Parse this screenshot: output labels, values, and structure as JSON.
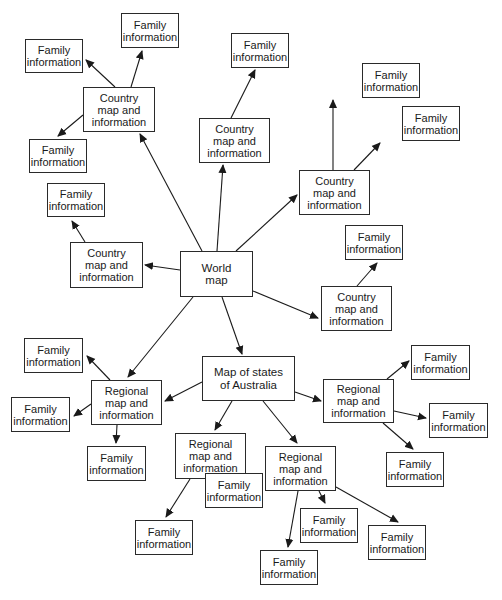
{
  "diagram": {
    "title": "",
    "nodes": [
      {
        "id": "world",
        "label": "World\nmap",
        "x": 180,
        "y": 251,
        "w": 73,
        "h": 46
      },
      {
        "id": "australia",
        "label": "Map of states\nof Australia",
        "x": 202,
        "y": 356,
        "w": 93,
        "h": 45
      },
      {
        "id": "country_tl",
        "label": "Country\nmap and\ninformation",
        "x": 83,
        "y": 87,
        "w": 72,
        "h": 45
      },
      {
        "id": "country_c",
        "label": "Country\nmap and\ninformation",
        "x": 199,
        "y": 118,
        "w": 71,
        "h": 45
      },
      {
        "id": "country_r",
        "label": "Country\nmap and\ninformation",
        "x": 299,
        "y": 170,
        "w": 71,
        "h": 45
      },
      {
        "id": "country_l",
        "label": "Country\nmap and\ninformation",
        "x": 70,
        "y": 242,
        "w": 73,
        "h": 46
      },
      {
        "id": "country_rl",
        "label": "Country\nmap and\ninformation",
        "x": 321,
        "y": 286,
        "w": 71,
        "h": 45
      },
      {
        "id": "regional_l",
        "label": "Regional\nmap and\ninformation",
        "x": 91,
        "y": 380,
        "w": 71,
        "h": 45
      },
      {
        "id": "regional_c1",
        "label": "Regional\nmap and\ninformation",
        "x": 175,
        "y": 433,
        "w": 71,
        "h": 46
      },
      {
        "id": "regional_c2",
        "label": "Regional\nmap and\ninformation",
        "x": 265,
        "y": 446,
        "w": 71,
        "h": 45
      },
      {
        "id": "regional_r",
        "label": "Regional\nmap and\ninformation",
        "x": 323,
        "y": 379,
        "w": 71,
        "h": 44
      },
      {
        "id": "fi_1",
        "label": "Family\ninformation",
        "x": 25,
        "y": 39,
        "w": 58,
        "h": 34
      },
      {
        "id": "fi_2",
        "label": "Family\ninformation",
        "x": 121,
        "y": 13,
        "w": 58,
        "h": 35
      },
      {
        "id": "fi_3",
        "label": "Family\ninformation",
        "x": 29,
        "y": 139,
        "w": 58,
        "h": 34
      },
      {
        "id": "fi_4",
        "label": "Family\ninformation",
        "x": 231,
        "y": 33,
        "w": 58,
        "h": 35
      },
      {
        "id": "fi_5",
        "label": "Family\ninformation",
        "x": 362,
        "y": 63,
        "w": 58,
        "h": 35
      },
      {
        "id": "fi_6",
        "label": "Family\ninformation",
        "x": 402,
        "y": 106,
        "w": 58,
        "h": 35
      },
      {
        "id": "fi_7",
        "label": "Family\ninformation",
        "x": 47,
        "y": 183,
        "w": 58,
        "h": 34
      },
      {
        "id": "fi_8",
        "label": "Family\ninformation",
        "x": 345,
        "y": 225,
        "w": 58,
        "h": 35
      },
      {
        "id": "fi_9",
        "label": "Family\ninformation",
        "x": 24,
        "y": 338,
        "w": 59,
        "h": 35
      },
      {
        "id": "fi_10",
        "label": "Family\ninformation",
        "x": 11,
        "y": 397,
        "w": 59,
        "h": 35
      },
      {
        "id": "fi_11",
        "label": "Family\ninformation",
        "x": 87,
        "y": 446,
        "w": 59,
        "h": 35
      },
      {
        "id": "fi_12",
        "label": "Family\ninformation",
        "x": 205,
        "y": 473,
        "w": 58,
        "h": 35
      },
      {
        "id": "fi_13",
        "label": "Family\ninformation",
        "x": 135,
        "y": 520,
        "w": 58,
        "h": 35
      },
      {
        "id": "fi_14",
        "label": "Family\ninformation",
        "x": 300,
        "y": 508,
        "w": 58,
        "h": 35
      },
      {
        "id": "fi_15",
        "label": "Family\ninformation",
        "x": 368,
        "y": 525,
        "w": 58,
        "h": 35
      },
      {
        "id": "fi_16",
        "label": "Family\ninformation",
        "x": 260,
        "y": 550,
        "w": 58,
        "h": 35
      },
      {
        "id": "fi_17",
        "label": "Family\ninformation",
        "x": 411,
        "y": 345,
        "w": 59,
        "h": 35
      },
      {
        "id": "fi_18",
        "label": "Family\ninformation",
        "x": 429,
        "y": 403,
        "w": 59,
        "h": 35
      },
      {
        "id": "fi_19",
        "label": "Family\ninformation",
        "x": 386,
        "y": 452,
        "w": 58,
        "h": 35
      }
    ],
    "edges": [
      {
        "from": "world",
        "to": "country_tl",
        "x1": 202,
        "y1": 251,
        "x2": 140,
        "y2": 134
      },
      {
        "from": "world",
        "to": "country_c",
        "x1": 217,
        "y1": 251,
        "x2": 223,
        "y2": 165
      },
      {
        "from": "world",
        "to": "country_r",
        "x1": 236,
        "y1": 251,
        "x2": 297,
        "y2": 195
      },
      {
        "from": "world",
        "to": "country_l",
        "x1": 180,
        "y1": 270,
        "x2": 145,
        "y2": 265
      },
      {
        "from": "world",
        "to": "country_rl",
        "x1": 253,
        "y1": 291,
        "x2": 318,
        "y2": 318
      },
      {
        "from": "world",
        "to": "regional_l",
        "x1": 193,
        "y1": 297,
        "x2": 128,
        "y2": 377
      },
      {
        "from": "world",
        "to": "australia",
        "x1": 222,
        "y1": 297,
        "x2": 242,
        "y2": 354
      },
      {
        "from": "country_tl",
        "to": "fi_1",
        "x1": 115,
        "y1": 87,
        "x2": 86,
        "y2": 60
      },
      {
        "from": "country_tl",
        "to": "fi_2",
        "x1": 131,
        "y1": 87,
        "x2": 142,
        "y2": 51
      },
      {
        "from": "country_tl",
        "to": "fi_3",
        "x1": 83,
        "y1": 115,
        "x2": 58,
        "y2": 136
      },
      {
        "from": "country_c",
        "to": "fi_4",
        "x1": 231,
        "y1": 118,
        "x2": 255,
        "y2": 70
      },
      {
        "from": "country_r",
        "to": "fi_5",
        "x1": 333,
        "y1": 170,
        "x2": 333,
        "y2": 100
      },
      {
        "from": "country_r",
        "to": "fi_6",
        "x1": 354,
        "y1": 170,
        "x2": 380,
        "y2": 143
      },
      {
        "from": "country_l",
        "to": "fi_7",
        "x1": 85,
        "y1": 242,
        "x2": 72,
        "y2": 221
      },
      {
        "from": "country_rl",
        "to": "fi_8",
        "x1": 357,
        "y1": 286,
        "x2": 377,
        "y2": 263
      },
      {
        "from": "australia",
        "to": "regional_l",
        "x1": 202,
        "y1": 382,
        "x2": 165,
        "y2": 401
      },
      {
        "from": "australia",
        "to": "regional_c1",
        "x1": 232,
        "y1": 401,
        "x2": 215,
        "y2": 430
      },
      {
        "from": "australia",
        "to": "regional_c2",
        "x1": 263,
        "y1": 401,
        "x2": 297,
        "y2": 443
      },
      {
        "from": "australia",
        "to": "regional_r",
        "x1": 295,
        "y1": 392,
        "x2": 321,
        "y2": 401
      },
      {
        "from": "regional_l",
        "to": "fi_9",
        "x1": 110,
        "y1": 380,
        "x2": 87,
        "y2": 356
      },
      {
        "from": "regional_l",
        "to": "fi_10",
        "x1": 91,
        "y1": 404,
        "x2": 74,
        "y2": 416
      },
      {
        "from": "regional_l",
        "to": "fi_11",
        "x1": 117,
        "y1": 425,
        "x2": 116,
        "y2": 443
      },
      {
        "from": "regional_c1",
        "to": "fi_13",
        "x1": 190,
        "y1": 479,
        "x2": 166,
        "y2": 517
      },
      {
        "from": "regional_c1",
        "to": "fi_12",
        "x1": 226,
        "y1": 479,
        "x2": 234,
        "y2": 492
      },
      {
        "from": "regional_c2",
        "to": "fi_16",
        "x1": 298,
        "y1": 491,
        "x2": 288,
        "y2": 547
      },
      {
        "from": "regional_c2",
        "to": "fi_14",
        "x1": 319,
        "y1": 491,
        "x2": 325,
        "y2": 503
      },
      {
        "from": "regional_c2",
        "to": "fi_15",
        "x1": 336,
        "y1": 487,
        "x2": 398,
        "y2": 522
      },
      {
        "from": "regional_r",
        "to": "fi_17",
        "x1": 387,
        "y1": 379,
        "x2": 409,
        "y2": 361
      },
      {
        "from": "regional_r",
        "to": "fi_18",
        "x1": 394,
        "y1": 411,
        "x2": 426,
        "y2": 418
      },
      {
        "from": "regional_r",
        "to": "fi_19",
        "x1": 383,
        "y1": 423,
        "x2": 413,
        "y2": 449
      }
    ]
  }
}
